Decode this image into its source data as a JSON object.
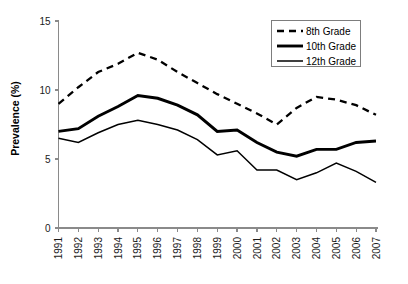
{
  "chart_data": {
    "type": "line",
    "title": "",
    "xlabel": "",
    "ylabel": "Prevalence (%)",
    "ylim": [
      0,
      15
    ],
    "yticks": [
      0,
      5,
      10,
      15
    ],
    "ytick_labels": [
      "0",
      "5",
      "10",
      "15"
    ],
    "grid": false,
    "legend_position": "top-right",
    "categories": [
      "1991",
      "1992",
      "1993",
      "1994",
      "1995",
      "1996",
      "1997",
      "1998",
      "1999",
      "2000",
      "2001",
      "2002",
      "2003",
      "2004",
      "2005",
      "2006",
      "2007"
    ],
    "series": [
      {
        "name": "8th Grade",
        "style": "dashed-thick",
        "values": [
          9.0,
          10.2,
          11.3,
          11.9,
          12.7,
          12.2,
          11.3,
          10.5,
          9.7,
          9.0,
          8.3,
          7.5,
          8.7,
          9.5,
          9.3,
          8.9,
          8.2
        ]
      },
      {
        "name": "10th Grade",
        "style": "solid-thick",
        "values": [
          7.0,
          7.2,
          8.1,
          8.8,
          9.6,
          9.4,
          8.9,
          8.2,
          7.0,
          7.1,
          6.2,
          5.5,
          5.2,
          5.7,
          5.7,
          6.2,
          6.3
        ]
      },
      {
        "name": "12th Grade",
        "style": "solid-thin",
        "values": [
          6.5,
          6.2,
          6.9,
          7.5,
          7.8,
          7.5,
          7.1,
          6.4,
          5.3,
          5.6,
          4.2,
          4.2,
          3.5,
          4.0,
          4.7,
          4.1,
          3.3
        ]
      }
    ],
    "colors": {
      "line": "#000000",
      "axis": "#8a8a8a",
      "background": "#ffffff"
    }
  },
  "legend": {
    "entries": [
      {
        "label": "8th Grade"
      },
      {
        "label": "10th Grade"
      },
      {
        "label": "12th Grade"
      }
    ]
  }
}
